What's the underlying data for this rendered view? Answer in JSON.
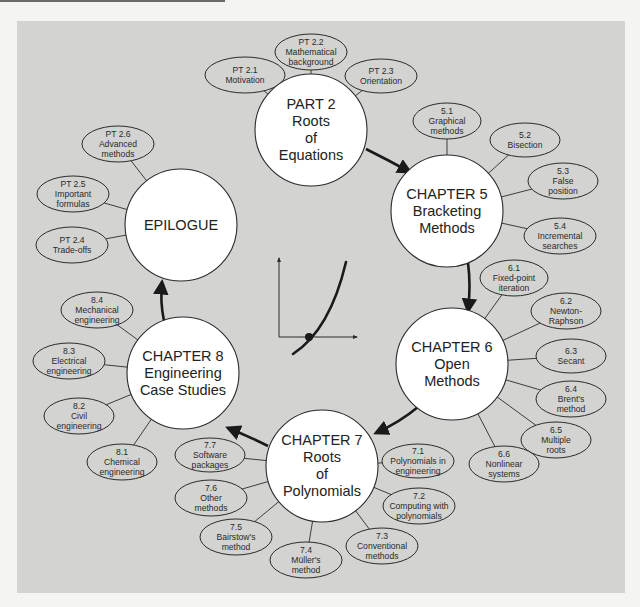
{
  "diagram": {
    "colors": {
      "background": "#f4f4f2",
      "panel": "#d3d3d1",
      "node_fill": "#ffffff",
      "stroke": "#2b2b2b",
      "arrow": "#1a1a1a"
    },
    "main_nodes": [
      {
        "id": "part2",
        "lines": [
          "PART 2",
          "Roots",
          "of",
          "Equations"
        ],
        "cx": 311,
        "cy": 130,
        "r": 56
      },
      {
        "id": "ch5",
        "lines": [
          "CHAPTER 5",
          "Bracketing",
          "Methods"
        ],
        "cx": 447,
        "cy": 211,
        "r": 56
      },
      {
        "id": "ch6",
        "lines": [
          "CHAPTER 6",
          "Open",
          "Methods"
        ],
        "cx": 452,
        "cy": 364,
        "r": 56
      },
      {
        "id": "ch7",
        "lines": [
          "CHAPTER 7",
          "Roots",
          "of",
          "Polynomials"
        ],
        "cx": 322,
        "cy": 466,
        "r": 56
      },
      {
        "id": "ch8",
        "lines": [
          "CHAPTER 8",
          "Engineering",
          "Case Studies"
        ],
        "cx": 183,
        "cy": 373,
        "r": 56
      },
      {
        "id": "epilogue",
        "lines": [
          "EPILOGUE"
        ],
        "cx": 181,
        "cy": 225,
        "r": 56
      }
    ],
    "sub_nodes": [
      {
        "id": "pt21",
        "parent": "part2",
        "lines": [
          "PT 2.1",
          "Motivation"
        ],
        "cx": 245,
        "cy": 75,
        "rx": 40,
        "ry": 18
      },
      {
        "id": "pt22",
        "parent": "part2",
        "lines": [
          "PT 2.2",
          "Mathematical",
          "background"
        ],
        "cx": 311,
        "cy": 52,
        "rx": 36,
        "ry": 18
      },
      {
        "id": "pt23",
        "parent": "part2",
        "lines": [
          "PT 2.3",
          "Orientation"
        ],
        "cx": 381,
        "cy": 76,
        "rx": 36,
        "ry": 17
      },
      {
        "id": "s51",
        "parent": "ch5",
        "lines": [
          "5.1",
          "Graphical",
          "methods"
        ],
        "cx": 447,
        "cy": 121,
        "rx": 34,
        "ry": 18
      },
      {
        "id": "s52",
        "parent": "ch5",
        "lines": [
          "5.2",
          "Bisection"
        ],
        "cx": 525,
        "cy": 140,
        "rx": 35,
        "ry": 17
      },
      {
        "id": "s53",
        "parent": "ch5",
        "lines": [
          "5.3",
          "False",
          "position"
        ],
        "cx": 563,
        "cy": 181,
        "rx": 35,
        "ry": 18
      },
      {
        "id": "s54",
        "parent": "ch5",
        "lines": [
          "5.4",
          "Incremental",
          "searches"
        ],
        "cx": 560,
        "cy": 236,
        "rx": 36,
        "ry": 18
      },
      {
        "id": "s61",
        "parent": "ch6",
        "lines": [
          "6.1",
          "Fixed-point",
          "iteration"
        ],
        "cx": 514,
        "cy": 278,
        "rx": 34,
        "ry": 18
      },
      {
        "id": "s62",
        "parent": "ch6",
        "lines": [
          "6.2",
          "Newton-",
          "Raphson"
        ],
        "cx": 566,
        "cy": 311,
        "rx": 35,
        "ry": 18
      },
      {
        "id": "s63",
        "parent": "ch6",
        "lines": [
          "6.3",
          "Secant"
        ],
        "cx": 571,
        "cy": 356,
        "rx": 35,
        "ry": 17
      },
      {
        "id": "s64",
        "parent": "ch6",
        "lines": [
          "6.4",
          "Brent's",
          "method"
        ],
        "cx": 571,
        "cy": 399,
        "rx": 35,
        "ry": 18
      },
      {
        "id": "s65",
        "parent": "ch6",
        "lines": [
          "6.5",
          "Multiple",
          "roots"
        ],
        "cx": 556,
        "cy": 440,
        "rx": 35,
        "ry": 18
      },
      {
        "id": "s66",
        "parent": "ch6",
        "lines": [
          "6.6",
          "Nonlinear",
          "systems"
        ],
        "cx": 504,
        "cy": 464,
        "rx": 35,
        "ry": 18
      },
      {
        "id": "s71",
        "parent": "ch7",
        "lines": [
          "7.1",
          "Polynomials in",
          "engineering"
        ],
        "cx": 418,
        "cy": 461,
        "rx": 36,
        "ry": 17
      },
      {
        "id": "s72",
        "parent": "ch7",
        "lines": [
          "7.2",
          "Computing with",
          "polynomials"
        ],
        "cx": 419,
        "cy": 506,
        "rx": 36,
        "ry": 18
      },
      {
        "id": "s73",
        "parent": "ch7",
        "lines": [
          "7.3",
          "Conventional",
          "methods"
        ],
        "cx": 382,
        "cy": 546,
        "rx": 36,
        "ry": 18
      },
      {
        "id": "s74",
        "parent": "ch7",
        "lines": [
          "7.4",
          "Müller's",
          "method"
        ],
        "cx": 306,
        "cy": 560,
        "rx": 36,
        "ry": 18
      },
      {
        "id": "s75",
        "parent": "ch7",
        "lines": [
          "7.5",
          "Bairstow's",
          "method"
        ],
        "cx": 236,
        "cy": 537,
        "rx": 36,
        "ry": 18
      },
      {
        "id": "s76",
        "parent": "ch7",
        "lines": [
          "7.6",
          "Other",
          "methods"
        ],
        "cx": 211,
        "cy": 498,
        "rx": 36,
        "ry": 18
      },
      {
        "id": "s77",
        "parent": "ch7",
        "lines": [
          "7.7",
          "Software",
          "packages"
        ],
        "cx": 210,
        "cy": 455,
        "rx": 35,
        "ry": 17
      },
      {
        "id": "s81",
        "parent": "ch8",
        "lines": [
          "8.1",
          "Chemical",
          "engineering"
        ],
        "cx": 122,
        "cy": 462,
        "rx": 35,
        "ry": 18
      },
      {
        "id": "s82",
        "parent": "ch8",
        "lines": [
          "8.2",
          "Civil",
          "engineering"
        ],
        "cx": 79,
        "cy": 416,
        "rx": 35,
        "ry": 18
      },
      {
        "id": "s83",
        "parent": "ch8",
        "lines": [
          "8.3",
          "Electrical",
          "engineering"
        ],
        "cx": 69,
        "cy": 361,
        "rx": 36,
        "ry": 18
      },
      {
        "id": "s84",
        "parent": "ch8",
        "lines": [
          "8.4",
          "Mechanical",
          "engineering"
        ],
        "cx": 97,
        "cy": 310,
        "rx": 36,
        "ry": 18
      },
      {
        "id": "pt24",
        "parent": "epilogue",
        "lines": [
          "PT 2.4",
          "Trade-offs"
        ],
        "cx": 72,
        "cy": 245,
        "rx": 36,
        "ry": 18
      },
      {
        "id": "pt25",
        "parent": "epilogue",
        "lines": [
          "PT 2.5",
          "Important",
          "formulas"
        ],
        "cx": 73,
        "cy": 194,
        "rx": 36,
        "ry": 18
      },
      {
        "id": "pt26",
        "parent": "epilogue",
        "lines": [
          "PT 2.6",
          "Advanced",
          "methods"
        ],
        "cx": 118,
        "cy": 144,
        "rx": 36,
        "ry": 18
      }
    ],
    "flow_arrows": [
      {
        "from": "part2",
        "to": "ch5",
        "path": "M 366 149 Q 388 160 410 172"
      },
      {
        "from": "ch5",
        "to": "ch6",
        "path": "M 468 263 Q 471 285 468 311"
      },
      {
        "from": "ch6",
        "to": "ch7",
        "path": "M 418 407 Q 400 422 376 433"
      },
      {
        "from": "ch7",
        "to": "ch8",
        "path": "M 268 446 Q 248 436 228 428"
      },
      {
        "from": "ch8",
        "to": "epilogue",
        "path": "M 164 321 Q 160 302 162 282"
      }
    ],
    "center_graphic": {
      "name": "function-root-plot",
      "x_axis": {
        "x1": 279,
        "y1": 337,
        "x2": 357,
        "y2": 337
      },
      "y_axis": {
        "x1": 279,
        "y1": 337,
        "x2": 279,
        "y2": 258
      },
      "curve": "M 293 354 Q 330 330 346 262",
      "root_point": {
        "cx": 309,
        "cy": 337,
        "r": 4
      }
    }
  }
}
